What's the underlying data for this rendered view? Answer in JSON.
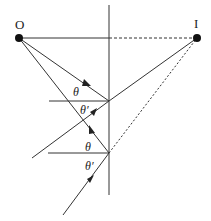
{
  "diagram": {
    "title": "",
    "colors": {
      "line": "#333333",
      "dot": "#111111",
      "background": "#ffffff"
    },
    "points": {
      "object": {
        "label": "O",
        "x": 19,
        "y": 38
      },
      "image": {
        "label": "I",
        "x": 197,
        "y": 38
      },
      "reflection_1": {
        "x": 109,
        "y": 101
      },
      "reflection_2": {
        "x": 109,
        "y": 153
      }
    },
    "mirror": {
      "x": 109,
      "y1": 5,
      "y2": 195
    },
    "angle_labels": {
      "incidence_1": "θ",
      "reflection_1": "θ′",
      "incidence_2": "θ",
      "reflection_2": "θ′"
    },
    "edges": [
      {
        "from": "O",
        "to": "mirror-axis",
        "style": "solid"
      },
      {
        "from": "mirror-axis",
        "to": "I",
        "style": "dashed"
      },
      {
        "from": "O",
        "to": "reflection_1",
        "style": "solid",
        "arrow": true
      },
      {
        "from": "reflection_1",
        "to": "lower-left",
        "style": "solid",
        "arrow": true
      },
      {
        "from": "reflection_1",
        "to": "I",
        "style": "solid"
      },
      {
        "from": "O",
        "to": "reflection_2",
        "style": "solid",
        "arrow": true
      },
      {
        "from": "reflection_2",
        "to": "lower-left",
        "style": "solid",
        "arrow": true
      },
      {
        "from": "reflection_2",
        "to": "I",
        "style": "dotted"
      }
    ]
  }
}
